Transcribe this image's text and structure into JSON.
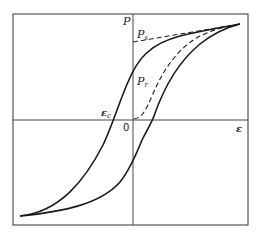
{
  "diagram": {
    "type": "hysteresis-loop",
    "labels": {
      "y_axis": "P",
      "x_axis": "ε",
      "origin": "0",
      "saturation": {
        "main": "P",
        "sub": "s"
      },
      "remanent": {
        "main": "P",
        "sub": "r"
      },
      "coercive": {
        "main": "ε",
        "sub": "c"
      }
    },
    "colors": {
      "curve": "#1a1a1a",
      "axis": "#333333",
      "background": "#ffffff"
    },
    "curves": [
      {
        "name": "upper-branch",
        "style": "solid"
      },
      {
        "name": "lower-branch",
        "style": "solid"
      },
      {
        "name": "initial-polarization-curve",
        "style": "dashed"
      },
      {
        "name": "saturation-extrapolation-line",
        "style": "dashed"
      }
    ]
  }
}
